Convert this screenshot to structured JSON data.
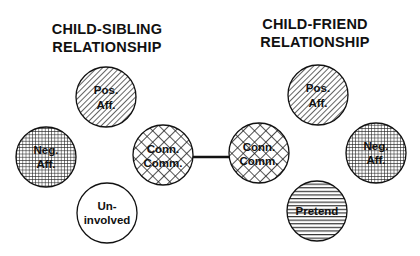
{
  "panels": [
    {
      "title_line1": "CHILD-SIBLING",
      "title_line2": "RELATIONSHIP",
      "nodes": [
        {
          "id": "sib-pos-aff",
          "line1": "Pos.",
          "line2": "Aff.",
          "pattern": "diagonal-hatch"
        },
        {
          "id": "sib-neg-aff",
          "line1": "Neg.",
          "line2": "Aff.",
          "pattern": "fine-grid"
        },
        {
          "id": "sib-conn-comm",
          "line1": "Conn.",
          "line2": "Comm.",
          "pattern": "diamond-crosshatch"
        },
        {
          "id": "sib-uninvolved",
          "line1": "Un-",
          "line2": "involved",
          "pattern": "none"
        }
      ]
    },
    {
      "title_line1": "CHILD-FRIEND",
      "title_line2": "RELATIONSHIP",
      "nodes": [
        {
          "id": "fr-pos-aff",
          "line1": "Pos.",
          "line2": "Aff.",
          "pattern": "diagonal-hatch"
        },
        {
          "id": "fr-neg-aff",
          "line1": "Neg.",
          "line2": "Aff.",
          "pattern": "fine-grid"
        },
        {
          "id": "fr-conn-comm",
          "line1": "Conn.",
          "line2": "Comm.",
          "pattern": "diamond-crosshatch"
        },
        {
          "id": "fr-pretend",
          "line1": "Pretend",
          "line2": "",
          "pattern": "horizontal-lines"
        }
      ]
    }
  ],
  "connector": {
    "from": "sib-conn-comm",
    "to": "fr-conn-comm"
  },
  "colors": {
    "ink": "#111111",
    "background": "#ffffff"
  }
}
